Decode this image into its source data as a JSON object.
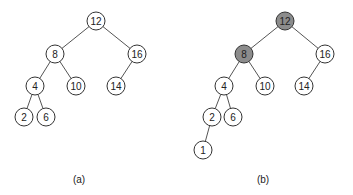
{
  "colors": {
    "normal_fill": "#ffffff",
    "highlight_fill": "#8c8c8c",
    "stroke": "#333333",
    "edge": "#555555"
  },
  "node_radius": 9,
  "trees": [
    {
      "caption": "(a)",
      "caption_pos": [
        79,
        179
      ],
      "nodes": [
        {
          "id": "12",
          "label": "12",
          "x": 96,
          "y": 21,
          "highlight": false
        },
        {
          "id": "8",
          "label": "8",
          "x": 55,
          "y": 54,
          "highlight": false
        },
        {
          "id": "16",
          "label": "16",
          "x": 137,
          "y": 54,
          "highlight": false
        },
        {
          "id": "4",
          "label": "4",
          "x": 35,
          "y": 86,
          "highlight": false
        },
        {
          "id": "10",
          "label": "10",
          "x": 76,
          "y": 86,
          "highlight": false
        },
        {
          "id": "14",
          "label": "14",
          "x": 116,
          "y": 86,
          "highlight": false
        },
        {
          "id": "2",
          "label": "2",
          "x": 24,
          "y": 117,
          "highlight": false
        },
        {
          "id": "6",
          "label": "6",
          "x": 46,
          "y": 117,
          "highlight": false
        }
      ],
      "edges": [
        [
          "12",
          "8"
        ],
        [
          "12",
          "16"
        ],
        [
          "8",
          "4"
        ],
        [
          "8",
          "10"
        ],
        [
          "16",
          "14"
        ],
        [
          "4",
          "2"
        ],
        [
          "4",
          "6"
        ]
      ]
    },
    {
      "caption": "(b)",
      "caption_pos": [
        263,
        179
      ],
      "nodes": [
        {
          "id": "12",
          "label": "12",
          "x": 285,
          "y": 21,
          "highlight": true
        },
        {
          "id": "8",
          "label": "8",
          "x": 244,
          "y": 54,
          "highlight": true
        },
        {
          "id": "16",
          "label": "16",
          "x": 325,
          "y": 54,
          "highlight": false
        },
        {
          "id": "4",
          "label": "4",
          "x": 224,
          "y": 86,
          "highlight": false
        },
        {
          "id": "10",
          "label": "10",
          "x": 265,
          "y": 86,
          "highlight": false
        },
        {
          "id": "14",
          "label": "14",
          "x": 304,
          "y": 86,
          "highlight": false
        },
        {
          "id": "2",
          "label": "2",
          "x": 212,
          "y": 117,
          "highlight": false
        },
        {
          "id": "6",
          "label": "6",
          "x": 233,
          "y": 117,
          "highlight": false
        },
        {
          "id": "1",
          "label": "1",
          "x": 203,
          "y": 150,
          "highlight": false
        }
      ],
      "edges": [
        [
          "12",
          "8"
        ],
        [
          "12",
          "16"
        ],
        [
          "8",
          "4"
        ],
        [
          "8",
          "10"
        ],
        [
          "16",
          "14"
        ],
        [
          "4",
          "2"
        ],
        [
          "4",
          "6"
        ],
        [
          "2",
          "1"
        ]
      ]
    }
  ]
}
